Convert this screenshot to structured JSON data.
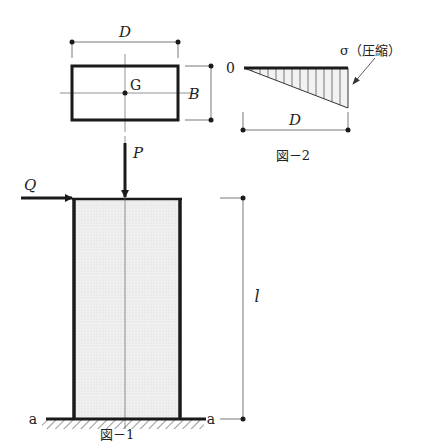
{
  "figure1": {
    "caption": "図－1",
    "load_vertical": "P",
    "load_horizontal": "Q",
    "height_label": "l",
    "section_left": "a",
    "section_right": "a"
  },
  "cross_section": {
    "width_label": "D",
    "depth_label": "B",
    "centroid_label": "G"
  },
  "figure2": {
    "caption": "図－2",
    "origin_label": "0",
    "stress_label": "σ（圧縮）",
    "width_label": "D"
  },
  "colors": {
    "line": "#1a1a1a",
    "fill": "#ececec",
    "thin": "#555555"
  }
}
